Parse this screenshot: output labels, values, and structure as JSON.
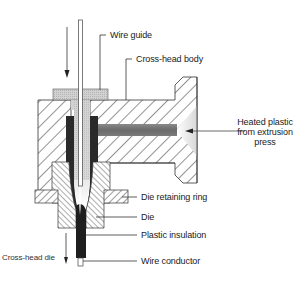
{
  "diagram": {
    "labels": {
      "wire_guide": "Wire guide",
      "cross_head_body": "Cross-head body",
      "heated_plastic_line1": "Heated plastic",
      "heated_plastic_line2": "from extrusion",
      "heated_plastic_line3": "press",
      "die_retaining_ring": "Die retaining ring",
      "die": "Die",
      "plastic_insulation": "Plastic insulation",
      "wire_conductor": "Wire conductor",
      "cross_head_die": "Cross-head die"
    },
    "colors": {
      "hatch": "#2a2a2a",
      "outline": "#333333",
      "plastic_dark": "#1e1e1e",
      "plastic_channel": "#6e6e6e",
      "wire_guide_fill": "#c8c8c8",
      "background": "#ffffff"
    },
    "arrows": {
      "wire_in": "down-arrow",
      "plastic_in": "left-arrow",
      "product_out": "down-arrow"
    }
  }
}
